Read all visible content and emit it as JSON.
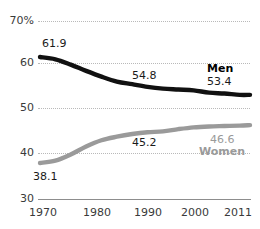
{
  "chart_data": {
    "type": "line",
    "title": "",
    "subtitle": "",
    "xlabel": "",
    "ylabel": "",
    "xlim": [
      1970,
      2011
    ],
    "ylim": [
      30,
      70
    ],
    "grid": true,
    "legend_position": "inline-right",
    "x_ticks": [
      "1970",
      "1980",
      "1990",
      "2000",
      "2011"
    ],
    "x_tick_values": [
      1970,
      1980,
      1990,
      2000,
      2011
    ],
    "y_ticks": [
      "70%",
      "60",
      "50",
      "40",
      "30"
    ],
    "y_tick_values": [
      70,
      60,
      50,
      40,
      30
    ],
    "series": [
      {
        "name": "Men",
        "color": "#111111",
        "x": [
          1970,
          1973,
          1976,
          1979,
          1982,
          1985,
          1988,
          1991,
          1994,
          1997,
          2000,
          2003,
          2006,
          2009,
          2011
        ],
        "values": [
          61.9,
          61.4,
          60.2,
          58.8,
          57.5,
          56.4,
          55.8,
          55.2,
          54.8,
          54.6,
          54.4,
          53.9,
          53.7,
          53.4,
          53.4
        ],
        "labels": [
          {
            "text": "61.9",
            "x": 1970,
            "value": 61.9
          },
          {
            "text": "54.8",
            "x": 1994,
            "value": 54.8
          },
          {
            "text": "53.4",
            "x": 2011,
            "value": 53.4
          }
        ]
      },
      {
        "name": "Women",
        "color": "#9a9a9a",
        "x": [
          1970,
          1973,
          1976,
          1979,
          1982,
          1985,
          1988,
          1991,
          1994,
          1997,
          2000,
          2003,
          2006,
          2009,
          2011
        ],
        "values": [
          38.1,
          38.6,
          40.0,
          41.8,
          43.2,
          44.0,
          44.6,
          45.0,
          45.2,
          45.7,
          46.1,
          46.3,
          46.4,
          46.5,
          46.6
        ],
        "labels": [
          {
            "text": "38.1",
            "x": 1970,
            "value": 38.1
          },
          {
            "text": "45.2",
            "x": 1994,
            "value": 45.2
          },
          {
            "text": "46.6",
            "x": 2011,
            "value": 46.6
          }
        ]
      }
    ]
  },
  "axis": {
    "y": [
      {
        "label": "70%"
      },
      {
        "label": "60"
      },
      {
        "label": "50"
      },
      {
        "label": "40"
      },
      {
        "label": "30"
      }
    ],
    "x": [
      {
        "label": "1970"
      },
      {
        "label": "1980"
      },
      {
        "label": "1990"
      },
      {
        "label": "2000"
      },
      {
        "label": "2011"
      }
    ]
  },
  "annotations": {
    "men_start": "61.9",
    "men_mid": "54.8",
    "men_end": "53.4",
    "men_name": "Men",
    "women_start": "38.1",
    "women_mid": "45.2",
    "women_end": "46.6",
    "women_name": "Women"
  },
  "colors": {
    "men_line": "#111111",
    "women_line": "#9a9a9a",
    "gridline": "#b9b9b9",
    "baseline": "#8d8d8d",
    "text": "#3a3a3a",
    "background": "#ffffff"
  }
}
